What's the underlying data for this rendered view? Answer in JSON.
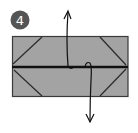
{
  "step": {
    "number": "4",
    "badge_color": "#555555",
    "text_color": "#ffffff"
  },
  "paper": {
    "fill": "#a3a3a3",
    "stroke": "#3a3a3a",
    "center_line_color": "#111111"
  },
  "arrows": [
    {
      "name": "fold-up-arrow",
      "direction": "up"
    },
    {
      "name": "fold-down-arrow",
      "direction": "down"
    }
  ]
}
